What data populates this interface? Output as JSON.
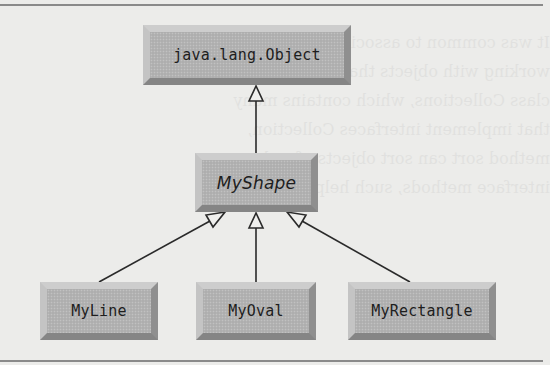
{
  "diagram": {
    "type": "uml-class-hierarchy",
    "relationship": "generalization (inheritance)",
    "nodes": [
      {
        "id": "object",
        "label": "java.lang.Object",
        "italic": false,
        "level": 0
      },
      {
        "id": "myshape",
        "label": "MyShape",
        "italic": true,
        "level": 1,
        "note": "abstract class (italic)"
      },
      {
        "id": "myline",
        "label": "MyLine",
        "italic": false,
        "level": 2
      },
      {
        "id": "myoval",
        "label": "MyOval",
        "italic": false,
        "level": 2
      },
      {
        "id": "myrect",
        "label": "MyRectangle",
        "italic": false,
        "level": 2
      }
    ],
    "edges": [
      {
        "from": "myshape",
        "to": "object",
        "arrow": "hollow-triangle"
      },
      {
        "from": "myline",
        "to": "myshape",
        "arrow": "hollow-triangle"
      },
      {
        "from": "myoval",
        "to": "myshape",
        "arrow": "hollow-triangle"
      },
      {
        "from": "myrect",
        "to": "myshape",
        "arrow": "hollow-triangle"
      }
    ]
  },
  "labels": {
    "object": "java.lang.Object",
    "myshape": "MyShape",
    "myline": "MyLine",
    "myoval": "MyOval",
    "myrect": "MyRectangle"
  },
  "colors": {
    "page_background": "#ececea",
    "box_fill": "#b3b3b3",
    "box_bevel_light": "#cdcdcd",
    "box_bevel_dark": "#858585",
    "line": "#2a2a2a",
    "text": "#1e1e1e"
  }
}
